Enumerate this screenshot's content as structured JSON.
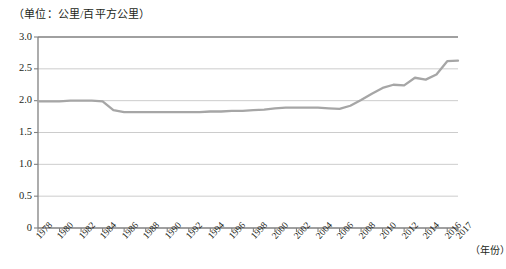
{
  "chart_data": {
    "type": "line",
    "title": "",
    "unit_caption": "（单位：公里/百平方公里）",
    "xlabel": "（年份）",
    "ylabel": "",
    "ylim": [
      0,
      3.0
    ],
    "xlim": [
      1978,
      2017
    ],
    "grid": true,
    "legend": false,
    "line_color": "#a6a6a6",
    "axis_color": "#808080",
    "grid_color": "#bfbfbf",
    "text_color": "#231f20",
    "ytick_labels": [
      "0",
      "0.5",
      "1.0",
      "1.5",
      "2.0",
      "2.5",
      "3.0"
    ],
    "ytick_values": [
      0,
      0.5,
      1.0,
      1.5,
      2.0,
      2.5,
      3.0
    ],
    "xtick_labels": [
      "1978",
      "1980",
      "1982",
      "1984",
      "1986",
      "1988",
      "1990",
      "1992",
      "1994",
      "1996",
      "1998",
      "2000",
      "2002",
      "2004",
      "2006",
      "2008",
      "2010",
      "2012",
      "2014",
      "2016",
      "2017"
    ],
    "xtick_values": [
      1978,
      1980,
      1982,
      1984,
      1986,
      1988,
      1990,
      1992,
      1994,
      1996,
      1998,
      2000,
      2002,
      2004,
      2006,
      2008,
      2010,
      2012,
      2014,
      2016,
      2017
    ],
    "x": [
      1978,
      1979,
      1980,
      1981,
      1982,
      1983,
      1984,
      1985,
      1986,
      1987,
      1988,
      1989,
      1990,
      1991,
      1992,
      1993,
      1994,
      1995,
      1996,
      1997,
      1998,
      1999,
      2000,
      2001,
      2002,
      2003,
      2004,
      2005,
      2006,
      2007,
      2008,
      2009,
      2010,
      2011,
      2012,
      2013,
      2014,
      2015,
      2016,
      2017
    ],
    "series": [
      {
        "name": "公路密度",
        "values": [
          1.99,
          1.99,
          1.99,
          2.0,
          2.0,
          2.0,
          1.99,
          1.85,
          1.82,
          1.82,
          1.82,
          1.82,
          1.82,
          1.82,
          1.82,
          1.82,
          1.83,
          1.83,
          1.84,
          1.84,
          1.85,
          1.86,
          1.88,
          1.89,
          1.89,
          1.89,
          1.89,
          1.88,
          1.87,
          1.92,
          2.01,
          2.11,
          2.2,
          2.25,
          2.24,
          2.36,
          2.33,
          2.41,
          2.62,
          2.63
        ]
      }
    ]
  }
}
